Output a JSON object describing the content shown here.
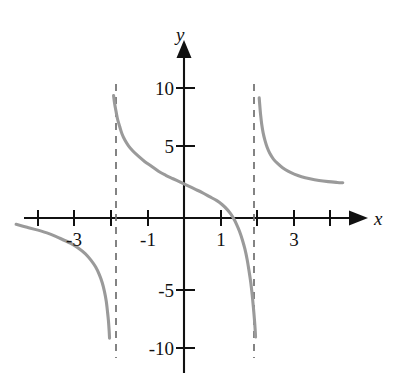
{
  "figure": {
    "background": "#ffffff",
    "width": 397,
    "height": 389
  },
  "chart_data": {
    "type": "line",
    "title": "",
    "subtitle": "",
    "xlabel": "x",
    "ylabel": "y",
    "xlim": [
      -4.8,
      5.4
    ],
    "ylim": [
      -13.5,
      14.5
    ],
    "grid": false,
    "legend": null,
    "axis_color": "#111111",
    "curve_color": "#9a9a9a",
    "asymptote_color": "#6e6e6e",
    "xticks": [
      -4,
      -3,
      -2,
      -1,
      1,
      2,
      3,
      4
    ],
    "xtick_labels": [
      "",
      "-3",
      "",
      "-1",
      "1",
      "",
      "3",
      ""
    ],
    "yticks": [
      -10,
      -5,
      5,
      10
    ],
    "ytick_labels": [
      "-10",
      "-5",
      "5",
      "10"
    ],
    "vertical_asymptotes": [
      -2,
      2
    ],
    "annotations": [
      {
        "text": "y",
        "role": "y-axis-label"
      },
      {
        "text": "x",
        "role": "x-axis-label"
      }
    ],
    "series": [
      {
        "name": "left-branch",
        "domain": [
          -4.6,
          -2.05
        ],
        "points": [
          [
            -4.6,
            -0.55
          ],
          [
            -4.3,
            -0.8
          ],
          [
            -4.0,
            -1.05
          ],
          [
            -3.7,
            -1.35
          ],
          [
            -3.4,
            -1.75
          ],
          [
            -3.1,
            -2.2
          ],
          [
            -2.9,
            -2.6
          ],
          [
            -2.7,
            -3.1
          ],
          [
            -2.55,
            -3.65
          ],
          [
            -2.42,
            -4.25
          ],
          [
            -2.32,
            -4.9
          ],
          [
            -2.24,
            -5.6
          ],
          [
            -2.18,
            -6.35
          ],
          [
            -2.13,
            -7.2
          ],
          [
            -2.1,
            -8.0
          ],
          [
            -2.07,
            -8.9
          ],
          [
            -2.05,
            -9.8
          ],
          [
            -2.04,
            -10.4
          ]
        ]
      },
      {
        "name": "middle-branch",
        "domain": [
          -1.93,
          1.96
        ],
        "points": [
          [
            -1.93,
            10.6
          ],
          [
            -1.9,
            9.9
          ],
          [
            -1.86,
            9.2
          ],
          [
            -1.82,
            8.55
          ],
          [
            -1.76,
            7.9
          ],
          [
            -1.7,
            7.3
          ],
          [
            -1.62,
            6.75
          ],
          [
            -1.52,
            6.25
          ],
          [
            -1.4,
            5.8
          ],
          [
            -1.25,
            5.35
          ],
          [
            -1.08,
            4.9
          ],
          [
            -0.9,
            4.5
          ],
          [
            -0.7,
            4.05
          ],
          [
            -0.5,
            3.7
          ],
          [
            -0.3,
            3.4
          ],
          [
            -0.1,
            3.1
          ],
          [
            0.1,
            2.8
          ],
          [
            0.3,
            2.5
          ],
          [
            0.5,
            2.2
          ],
          [
            0.7,
            1.85
          ],
          [
            0.9,
            1.5
          ],
          [
            1.05,
            1.15
          ],
          [
            1.18,
            0.75
          ],
          [
            1.28,
            0.35
          ],
          [
            1.36,
            -0.05
          ],
          [
            1.44,
            -0.55
          ],
          [
            1.52,
            -1.15
          ],
          [
            1.6,
            -1.9
          ],
          [
            1.67,
            -2.7
          ],
          [
            1.73,
            -3.6
          ],
          [
            1.78,
            -4.55
          ],
          [
            1.83,
            -5.6
          ],
          [
            1.87,
            -6.7
          ],
          [
            1.9,
            -7.7
          ],
          [
            1.93,
            -8.8
          ],
          [
            1.95,
            -9.7
          ],
          [
            1.96,
            -10.3
          ]
        ]
      },
      {
        "name": "right-branch",
        "domain": [
          2.06,
          4.35
        ],
        "points": [
          [
            2.06,
            10.4
          ],
          [
            2.08,
            9.6
          ],
          [
            2.1,
            8.9
          ],
          [
            2.13,
            8.1
          ],
          [
            2.17,
            7.35
          ],
          [
            2.22,
            6.7
          ],
          [
            2.28,
            6.1
          ],
          [
            2.35,
            5.6
          ],
          [
            2.45,
            5.1
          ],
          [
            2.57,
            4.7
          ],
          [
            2.7,
            4.35
          ],
          [
            2.85,
            4.05
          ],
          [
            3.02,
            3.8
          ],
          [
            3.22,
            3.58
          ],
          [
            3.45,
            3.4
          ],
          [
            3.7,
            3.25
          ],
          [
            3.95,
            3.15
          ],
          [
            4.2,
            3.08
          ],
          [
            4.35,
            3.05
          ]
        ]
      }
    ]
  }
}
